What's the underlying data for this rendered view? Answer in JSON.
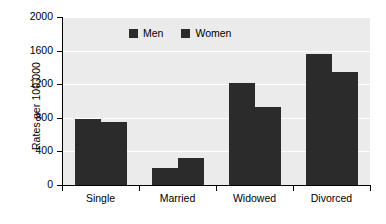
{
  "chart_data": {
    "type": "bar",
    "title": "",
    "xlabel": "",
    "ylabel": "Rates per 100,000",
    "categories": [
      "Single",
      "Married",
      "Widowed",
      "Divorced"
    ],
    "series": [
      {
        "name": "Men",
        "values": [
          790,
          200,
          1215,
          1555
        ]
      },
      {
        "name": "Women",
        "values": [
          755,
          320,
          925,
          1350
        ]
      }
    ],
    "ylim": [
      0,
      2000
    ],
    "yticks": [
      0,
      400,
      800,
      1200,
      1600,
      2000
    ],
    "ytick_labels": [
      "0",
      "400",
      "800",
      "1200",
      "1600",
      "2000"
    ],
    "grid": "horizontal-white",
    "legend_position": "top-center-inside",
    "colors": {
      "bar": "#2b2b2b",
      "plot_background": "#ebebeb",
      "gridline": "#ffffff",
      "axis": "#000000",
      "text": "#000000",
      "page_background": "#ffffff"
    }
  }
}
